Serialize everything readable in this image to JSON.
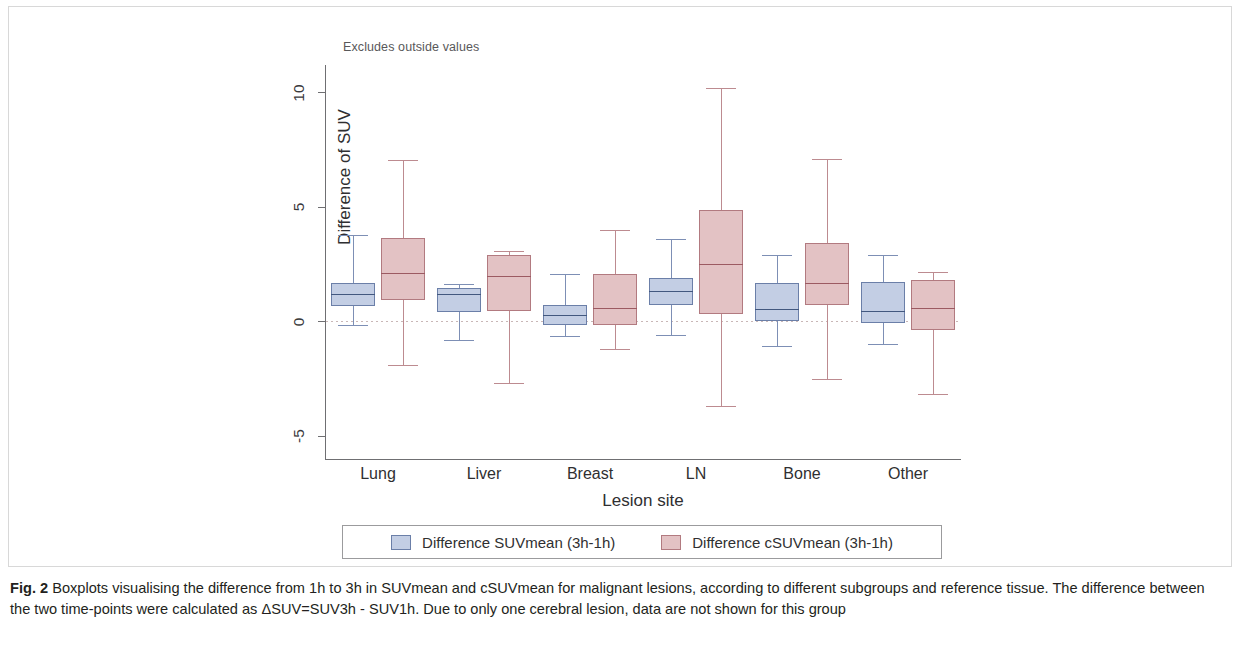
{
  "figure": {
    "note": "Excludes outside values",
    "caption_label": "Fig. 2",
    "caption_text": " Boxplots visualising the difference from 1h to 3h in SUVmean and cSUVmean for malignant lesions, according to different subgroups and reference tissue. The difference between the two time-points were calculated as ΔSUV=SUV3h - SUV1h. Due to only one cerebral lesion, data are not shown for this group"
  },
  "legend": {
    "items": [
      {
        "label": "Difference SUVmean (3h-1h)",
        "color": "#c3cee4"
      },
      {
        "label": "Difference cSUVmean (3h-1h)",
        "color": "#e3c2c4"
      }
    ]
  },
  "chart_data": {
    "type": "boxplot",
    "title": "",
    "subtitle": "Excludes outside values",
    "xlabel": "Lesion site",
    "ylabel": "Difference of SUV",
    "ylim": [
      -5.9,
      10.9
    ],
    "yticks": [
      10,
      5,
      0,
      -5
    ],
    "ytick_labels": [
      "10",
      "5",
      "0",
      "-5"
    ],
    "grid": false,
    "zero_reference_line": 0,
    "legend_position": "bottom",
    "categories": [
      "Lung",
      "Liver",
      "Breast",
      "LN",
      "Bone",
      "Other"
    ],
    "series": [
      {
        "name": "Difference SUVmean (3h-1h)",
        "color": "#c3cee4",
        "boxes": [
          {
            "category": "Lung",
            "whisker_low": -0.17,
            "q1": 0.66,
            "median": 1.18,
            "q3": 1.66,
            "whisker_high": 3.76
          },
          {
            "category": "Liver",
            "whisker_low": -0.83,
            "q1": 0.39,
            "median": 1.18,
            "q3": 1.44,
            "whisker_high": 1.62
          },
          {
            "category": "Breast",
            "whisker_low": -0.66,
            "q1": -0.17,
            "median": 0.26,
            "q3": 0.7,
            "whisker_high": 2.05
          },
          {
            "category": "LN",
            "whisker_low": -0.61,
            "q1": 0.7,
            "median": 1.31,
            "q3": 1.88,
            "whisker_high": 3.58
          },
          {
            "category": "Bone",
            "whisker_low": -1.09,
            "q1": 0.0,
            "median": 0.52,
            "q3": 1.66,
            "whisker_high": 2.88
          },
          {
            "category": "Other",
            "whisker_low": -1.0,
            "q1": -0.09,
            "median": 0.44,
            "q3": 1.7,
            "whisker_high": 2.88
          }
        ]
      },
      {
        "name": "Difference cSUVmean (3h-1h)",
        "color": "#e3c2c4",
        "boxes": [
          {
            "category": "Lung",
            "whisker_low": -1.92,
            "q1": 0.92,
            "median": 2.1,
            "q3": 3.62,
            "whisker_high": 7.03
          },
          {
            "category": "Liver",
            "whisker_low": -2.71,
            "q1": 0.44,
            "median": 1.97,
            "q3": 2.88,
            "whisker_high": 3.06
          },
          {
            "category": "Breast",
            "whisker_low": -1.22,
            "q1": -0.17,
            "median": 0.57,
            "q3": 2.05,
            "whisker_high": 3.98
          },
          {
            "category": "LN",
            "whisker_low": -3.71,
            "q1": 0.31,
            "median": 2.49,
            "q3": 4.85,
            "whisker_high": 10.17
          },
          {
            "category": "Bone",
            "whisker_low": -2.53,
            "q1": 0.7,
            "median": 1.66,
            "q3": 3.41,
            "whisker_high": 7.07
          },
          {
            "category": "Other",
            "whisker_low": -3.19,
            "q1": -0.39,
            "median": 0.57,
            "q3": 1.79,
            "whisker_high": 2.14
          }
        ]
      }
    ]
  }
}
